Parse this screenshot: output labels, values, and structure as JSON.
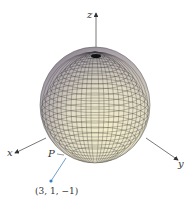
{
  "figure": {
    "type": "3d-sphere-diagram",
    "axes": {
      "x_label": "x",
      "y_label": "y",
      "z_label": "z"
    },
    "point": {
      "label": "P",
      "coordinates_label": "(3, 1, −1)"
    },
    "colors": {
      "sphere_light": "#f1ecc9",
      "sphere_mid": "#c9c2b4",
      "sphere_dark": "#6f6878",
      "grid": "#2a2a2a",
      "axis": "#444444",
      "point": "#3a7fc1",
      "connector": "#4a86c0"
    }
  }
}
